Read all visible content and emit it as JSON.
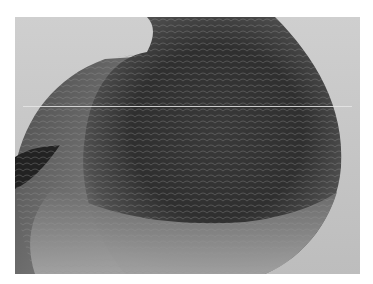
{
  "image": {
    "subject": "close-up photograph of a pigeon's breast and wing, grayscale",
    "alt": "Grayscale close-up of a pigeon's chest plumage",
    "colors": {
      "background": "#ffffff",
      "photo_background": "#c8c8c8",
      "plumage_dark": "#2e2e2e",
      "plumage_mid": "#5a5a5a",
      "plumage_light": "#9a9a9a"
    }
  }
}
